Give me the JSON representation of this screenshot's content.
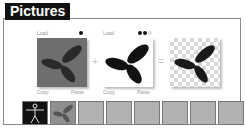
{
  "window": {
    "title": "Pictures"
  },
  "composer": {
    "panels": [
      {
        "id": "source",
        "top_label": "Load",
        "bottom_left": "Copy",
        "bottom_right": "Paste",
        "background": "#6e6e6e",
        "leaf_color": "#2a2a2a",
        "dots": 1
      },
      {
        "id": "mask",
        "top_label": "Load",
        "bottom_left": "Copy",
        "bottom_right": "Paste",
        "background": "#ffffff",
        "leaf_color": "#111111",
        "dots": 2
      },
      {
        "id": "result",
        "background": "checkerboard",
        "leaf_color": "#1a1a1a"
      }
    ],
    "operators": {
      "plus": "+",
      "equals": "="
    }
  },
  "thumbnail_strip": {
    "items": [
      {
        "type": "vitruvian-man-image"
      },
      {
        "type": "gray-leaves-image"
      },
      {
        "type": "empty"
      },
      {
        "type": "empty"
      },
      {
        "type": "empty"
      },
      {
        "type": "empty"
      },
      {
        "type": "empty"
      },
      {
        "type": "empty"
      }
    ]
  }
}
